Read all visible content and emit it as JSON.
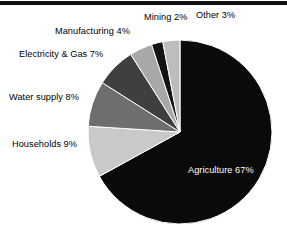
{
  "page": {
    "background_color": "#ffffff",
    "width": 287,
    "height": 246
  },
  "header_rule": {
    "color": "#101010"
  },
  "chart_data": {
    "type": "pie",
    "title": "",
    "subtitle": "",
    "xlabel": "",
    "ylabel": "",
    "legend_position": "none",
    "grid": false,
    "start_angle_deg": 0,
    "direction": "clockwise",
    "units": "percent",
    "total": 100,
    "categories": [
      "Agriculture",
      "Households",
      "Water supply",
      "Electricity & Gas",
      "Manufacturing",
      "Mining",
      "Other"
    ],
    "values": [
      67,
      9,
      8,
      7,
      4,
      2,
      3
    ],
    "colors": [
      "#0a0a0a",
      "#c9c9c9",
      "#6e6e6e",
      "#3f3f3f",
      "#a8a8a8",
      "#141414",
      "#bdbdbd"
    ],
    "slices": [
      {
        "label": "Agriculture",
        "value": 67,
        "value_label": "67%",
        "text": "Agriculture 67%",
        "color": "#0a0a0a",
        "label_placement": "inside",
        "label_color": "#ffffff"
      },
      {
        "label": "Households",
        "value": 9,
        "value_label": "9%",
        "text": "Households 9%",
        "color": "#c9c9c9",
        "label_placement": "outside-left",
        "label_color": "#000000"
      },
      {
        "label": "Water supply",
        "value": 8,
        "value_label": "8%",
        "text": "Water supply 8%",
        "color": "#6e6e6e",
        "label_placement": "outside-left",
        "label_color": "#000000"
      },
      {
        "label": "Electricity & Gas",
        "value": 7,
        "value_label": "7%",
        "text": "Electricity & Gas 7%",
        "color": "#3f3f3f",
        "label_placement": "outside-left",
        "label_color": "#000000"
      },
      {
        "label": "Manufacturing",
        "value": 4,
        "value_label": "4%",
        "text": "Manufacturing 4%",
        "color": "#a8a8a8",
        "label_placement": "outside-top-left",
        "label_color": "#000000"
      },
      {
        "label": "Mining",
        "value": 2,
        "value_label": "2%",
        "text": "Mining 2%",
        "color": "#141414",
        "label_placement": "outside-top",
        "label_color": "#000000"
      },
      {
        "label": "Other",
        "value": 3,
        "value_label": "3%",
        "text": "Other 3%",
        "color": "#bdbdbd",
        "label_placement": "outside-top",
        "label_color": "#000000"
      }
    ]
  }
}
